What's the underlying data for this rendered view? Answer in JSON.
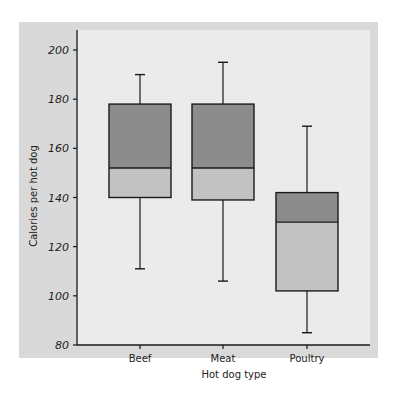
{
  "chart_data": {
    "type": "box",
    "title": "",
    "xlabel": "Hot dog type",
    "ylabel": "Calories per hot dog",
    "ylim": [
      80,
      205
    ],
    "yticks": [
      80,
      100,
      120,
      140,
      160,
      180,
      200
    ],
    "categories": [
      "Beef",
      "Meat",
      "Poultry"
    ],
    "series": [
      {
        "name": "Beef",
        "min": 111,
        "q1": 140,
        "median": 152,
        "q3": 178,
        "max": 190
      },
      {
        "name": "Meat",
        "min": 106,
        "q1": 139,
        "median": 152,
        "q3": 178,
        "max": 195
      },
      {
        "name": "Poultry",
        "min": 85,
        "q1": 102,
        "median": 130,
        "q3": 142,
        "max": 169
      }
    ],
    "colors": {
      "upper_box": "#8c8c8c",
      "lower_box": "#c2c2c2",
      "outline": "#1a1a1a",
      "frame": "#d9d9d9",
      "panel": "#ebebeb"
    },
    "grid": false,
    "legend": null
  }
}
